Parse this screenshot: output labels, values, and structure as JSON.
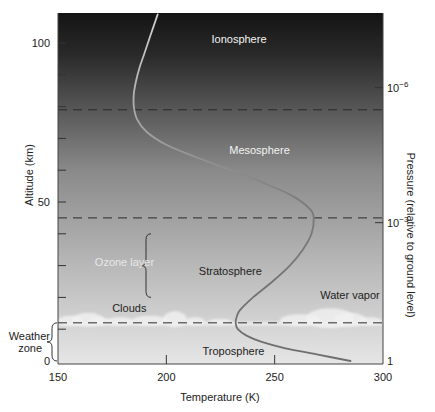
{
  "chart_data": {
    "type": "line",
    "title": "",
    "xlabel": "Temperature (K)",
    "ylabel": "Altitude (km)",
    "y2label": "Pressure (relative to ground level)",
    "xlim": [
      150,
      300
    ],
    "ylim": [
      0,
      109
    ],
    "grid": false,
    "x_ticks": [
      {
        "value": 150,
        "label": "150"
      },
      {
        "value": 200,
        "label": "200"
      },
      {
        "value": 250,
        "label": "250"
      },
      {
        "value": 300,
        "label": "300"
      }
    ],
    "y_ticks": [
      {
        "value": 0,
        "label": "0"
      },
      {
        "value": 10,
        "label": ""
      },
      {
        "value": 20,
        "label": ""
      },
      {
        "value": 30,
        "label": ""
      },
      {
        "value": 40,
        "label": ""
      },
      {
        "value": 50,
        "label": "50"
      },
      {
        "value": 60,
        "label": ""
      },
      {
        "value": 70,
        "label": ""
      },
      {
        "value": 80,
        "label": ""
      },
      {
        "value": 90,
        "label": ""
      },
      {
        "value": 100,
        "label": "100"
      }
    ],
    "y2_ticks": [
      {
        "altitude": 0,
        "base": "1",
        "exp": ""
      },
      {
        "altitude": 43.5,
        "base": "10",
        "exp": "−3"
      },
      {
        "altitude": 86,
        "base": "10",
        "exp": "−6"
      }
    ],
    "series": [
      {
        "name": "Temperature profile",
        "color": "#6e6e6e",
        "points": [
          {
            "alt": 0,
            "temp": 285
          },
          {
            "alt": 2,
            "temp": 270
          },
          {
            "alt": 4,
            "temp": 255
          },
          {
            "alt": 6,
            "temp": 244
          },
          {
            "alt": 8,
            "temp": 237
          },
          {
            "alt": 10,
            "temp": 233
          },
          {
            "alt": 12,
            "temp": 232
          },
          {
            "alt": 14,
            "temp": 232.5
          },
          {
            "alt": 16,
            "temp": 234
          },
          {
            "alt": 20,
            "temp": 240
          },
          {
            "alt": 25,
            "temp": 249
          },
          {
            "alt": 30,
            "temp": 257
          },
          {
            "alt": 35,
            "temp": 263
          },
          {
            "alt": 40,
            "temp": 267
          },
          {
            "alt": 45,
            "temp": 268
          },
          {
            "alt": 48,
            "temp": 266
          },
          {
            "alt": 52,
            "temp": 258
          },
          {
            "alt": 56,
            "temp": 245
          },
          {
            "alt": 60,
            "temp": 230
          },
          {
            "alt": 64,
            "temp": 214
          },
          {
            "alt": 68,
            "temp": 200
          },
          {
            "alt": 72,
            "temp": 191
          },
          {
            "alt": 76,
            "temp": 186.5
          },
          {
            "alt": 80,
            "temp": 185
          },
          {
            "alt": 84,
            "temp": 185
          },
          {
            "alt": 88,
            "temp": 186
          },
          {
            "alt": 92,
            "temp": 187.5
          },
          {
            "alt": 96,
            "temp": 189.5
          },
          {
            "alt": 100,
            "temp": 191.5
          },
          {
            "alt": 105,
            "temp": 194
          },
          {
            "alt": 109,
            "temp": 196
          }
        ]
      }
    ],
    "boundaries": [
      {
        "name": "tropopause",
        "alt": 12
      },
      {
        "name": "stratopause",
        "alt": 45
      },
      {
        "name": "mesopause",
        "alt": 79
      }
    ],
    "annotations": [
      {
        "id": "ionosphere",
        "text": "Ionosphere",
        "temp": 227,
        "alt": 100,
        "style": "white"
      },
      {
        "id": "mesosphere",
        "text": "Mesosphere",
        "temp": 243,
        "alt": 65,
        "style": "white"
      },
      {
        "id": "stratosphere",
        "text": "Stratosphere",
        "temp": 215,
        "alt": 27,
        "style": "dark"
      },
      {
        "id": "ozone-layer",
        "text": "Ozone layer",
        "temp": 167,
        "alt": 30,
        "style": "light"
      },
      {
        "id": "clouds",
        "text": "Clouds",
        "temp": 175,
        "alt": 15.5,
        "style": "dark"
      },
      {
        "id": "water-vapor",
        "text": "Water vapor",
        "temp": 271,
        "alt": 19.5,
        "style": "dark"
      },
      {
        "id": "troposphere",
        "text": "Troposphere",
        "temp": 231,
        "alt": 2,
        "style": "dark"
      },
      {
        "id": "weather-zone-1",
        "text": "Weather",
        "temp": 138,
        "alt": 6.5,
        "style": "outside"
      },
      {
        "id": "weather-zone-2",
        "text": "zone",
        "temp": 141,
        "alt": 2.7,
        "style": "outside"
      }
    ],
    "brackets": [
      {
        "name": "ozone-layer-bracket",
        "alt_from": 20,
        "alt_to": 40,
        "temp": 192
      },
      {
        "name": "weather-zone-bracket",
        "alt_from": 0,
        "alt_to": 12,
        "temp": 151
      }
    ],
    "background": {
      "type": "vertical-gradient",
      "top_color": "#141414",
      "mid_color": "#8a8a8a",
      "bottom_color": "#e6e6e6"
    }
  }
}
